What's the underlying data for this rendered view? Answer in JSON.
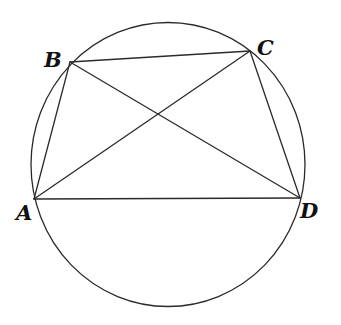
{
  "diagram": {
    "type": "cyclic-quadrilateral",
    "circle": {
      "cx": 168,
      "cy": 164.5,
      "rx": 137,
      "ry": 142
    },
    "points": {
      "A": {
        "label": "A",
        "x": 34,
        "y": 199,
        "label_x": 16,
        "label_y": 202
      },
      "B": {
        "label": "B",
        "x": 70,
        "y": 62,
        "label_x": 44,
        "label_y": 49
      },
      "C": {
        "label": "C",
        "x": 250,
        "y": 51,
        "label_x": 257,
        "label_y": 37
      },
      "D": {
        "label": "D",
        "x": 300,
        "y": 198,
        "label_x": 300,
        "label_y": 200
      }
    },
    "segments": [
      {
        "name": "AB",
        "from": "A",
        "to": "B"
      },
      {
        "name": "BC",
        "from": "B",
        "to": "C"
      },
      {
        "name": "CD",
        "from": "C",
        "to": "D"
      },
      {
        "name": "DA",
        "from": "D",
        "to": "A"
      },
      {
        "name": "AC",
        "from": "A",
        "to": "C"
      },
      {
        "name": "BD",
        "from": "B",
        "to": "D"
      }
    ],
    "colors": {
      "stroke": "#2a2a2a",
      "label": "#111111",
      "background": "#ffffff"
    }
  }
}
